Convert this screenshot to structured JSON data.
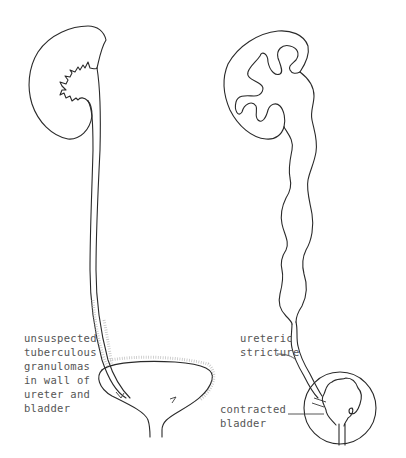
{
  "diagram": {
    "left_panel": {
      "subject": "kidney-and-ureter-normal-appearance",
      "label_lines": [
        "unsuspected",
        "tuberculous",
        "granulomas",
        "in wall of",
        "ureter and",
        "bladder"
      ]
    },
    "right_panel": {
      "subject": "kidney-with-dilated-ureter-and-contracted-bladder",
      "stricture_label_lines": [
        "ureteric",
        "stricture"
      ],
      "bladder_label_lines": [
        "contracted",
        "bladder"
      ]
    },
    "colors": {
      "line": "#2a2a2a",
      "text": "#555555",
      "stipple": "#b5b5b5",
      "background": "#ffffff"
    }
  }
}
